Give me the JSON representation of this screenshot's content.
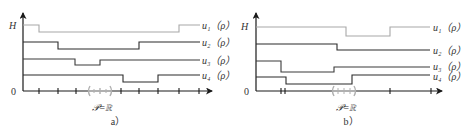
{
  "colors": {
    "axis": "#1a1a1a",
    "u1": "#a8a8a8",
    "u2": "#2a2a2a",
    "u3": "#3a3a3a",
    "u4": "#2a2a2a",
    "bracket": "#b0b0b0"
  },
  "panels": [
    {
      "caption": "a）",
      "y_top_label": "H",
      "origin_label": "0",
      "domain_label": "𝒫=ℝ",
      "curves": [
        {
          "name": "u1",
          "label": "u₁（ρ）"
        },
        {
          "name": "u2",
          "label": "u₂（ρ）"
        },
        {
          "name": "u3",
          "label": "u₃（ρ）"
        },
        {
          "name": "u4",
          "label": "u₄（ρ）"
        }
      ]
    },
    {
      "caption": "b）",
      "y_top_label": "H",
      "origin_label": "0",
      "domain_label": "𝒫=ℝ",
      "curves": [
        {
          "name": "u1",
          "label": "u₁（ρ）"
        },
        {
          "name": "u2",
          "label": "u₂（ρ）"
        },
        {
          "name": "u3",
          "label": "u₃（ρ）"
        },
        {
          "name": "u4",
          "label": "u₄（ρ）"
        }
      ]
    }
  ]
}
